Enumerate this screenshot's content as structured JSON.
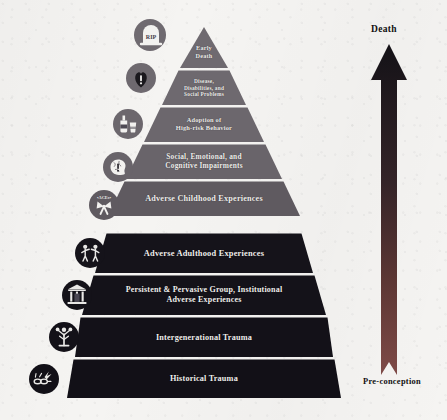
{
  "figure": {
    "background_color": "#f5f4f2",
    "tier_text_color": "#efeeec",
    "icon_ring_color": "#f5f4f2"
  },
  "pyramid": {
    "tiers": [
      {
        "id": "early-death",
        "label": "Early\nDeath",
        "label_lines": [
          "Early",
          "Death"
        ],
        "color": "#6f6a70",
        "icon_name": "tombstone-rip-icon",
        "icon_label": "RIP",
        "font_size": 6.2
      },
      {
        "id": "disease-disabilities-social-problems",
        "label": "Disease, Disabilities, and Social Problems",
        "label_lines": [
          "Disease,",
          "Disabilities, and",
          "Social Problems"
        ],
        "color": "#6e696f",
        "icon_name": "heart-alert-icon",
        "font_size": 5.4
      },
      {
        "id": "adoption-of-high-risk-behavior",
        "label": "Adoption of High-risk Behavior",
        "label_lines": [
          "Adoption of",
          "High-risk Behavior"
        ],
        "color": "#6c676d",
        "icon_name": "bottle-glass-icon",
        "font_size": 6.4
      },
      {
        "id": "social-emotional-cognitive-impairments",
        "label": "Social, Emotional, and Cognitive Impairments",
        "label_lines": [
          "Social, Emotional, and",
          "Cognitive Impairments"
        ],
        "color": "#69646a",
        "icon_name": "brain-alert-icon",
        "font_size": 7.4
      },
      {
        "id": "adverse-childhood-experiences",
        "label": "Adverse Childhood Experiences",
        "label_lines": [
          "Adverse Childhood Experiences"
        ],
        "color": "#5f5a60",
        "icon_name": "ribbon-bow-icon",
        "font_size": 8.2
      },
      {
        "id": "adverse-adulthood-experiences",
        "label": "Adverse Adulthood Experiences",
        "label_lines": [
          "Adverse Adulthood Experiences"
        ],
        "color": "#15131a",
        "icon_name": "two-people-conflict-icon",
        "font_size": 8.4
      },
      {
        "id": "persistent-pervasive-group-institutional",
        "label": "Persistent & Pervasive Group, Institutional Adverse Experiences",
        "label_lines": [
          "Persistent & Pervasive Group, Institutional",
          "Adverse Experiences"
        ],
        "color": "#141219",
        "icon_name": "institution-building-icon",
        "font_size": 8.0
      },
      {
        "id": "intergenerational-trauma",
        "label": "Intergenerational Trauma",
        "label_lines": [
          "Intergenerational Trauma"
        ],
        "color": "#131118",
        "icon_name": "family-tree-icon",
        "font_size": 8.2
      },
      {
        "id": "historical-trauma",
        "label": "Historical Trauma",
        "label_lines": [
          "Historical Trauma"
        ],
        "color": "#121017",
        "icon_name": "broken-chain-icon",
        "font_size": 8.2
      }
    ]
  },
  "arrow": {
    "name": "lifespan-arrow",
    "top_label": "Death",
    "bottom_label": "Pre-conception",
    "color_top": "#141217",
    "color_bottom": "#7e4a47"
  }
}
